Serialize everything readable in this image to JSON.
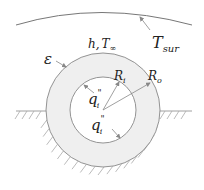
{
  "diagram": {
    "labels": {
      "surroundings": {
        "main": "T",
        "sub": "sur"
      },
      "convection": {
        "h": "h,",
        "T": "T",
        "sub": "∞"
      },
      "emissivity": "ε",
      "inner_radius": {
        "main": "R",
        "sub": "i"
      },
      "outer_radius": {
        "main": "R",
        "sub": "o"
      },
      "heat_flux_top": {
        "main": "q",
        "sup": "\"",
        "sub": "i"
      },
      "heat_flux_bottom": {
        "main": "q",
        "sup": "\"",
        "sub": "i"
      }
    },
    "colors": {
      "line": "#888888",
      "annulus_fill": "#efefef",
      "inner_fill": "#ffffff",
      "hatch": "#aaaaaa",
      "text": "#222222"
    }
  }
}
